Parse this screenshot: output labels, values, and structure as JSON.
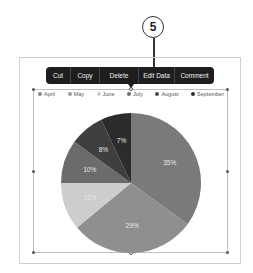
{
  "callout": {
    "number": "5"
  },
  "toolbar": {
    "items": [
      {
        "label": "Cut",
        "width": 25
      },
      {
        "label": "Copy",
        "width": 29
      },
      {
        "label": "Delete",
        "width": 39
      },
      {
        "label": "Edit Data",
        "width": 36
      },
      {
        "label": "Comment",
        "width": 39
      }
    ]
  },
  "legend": {
    "items": [
      {
        "label": "April",
        "color": "#8a8a8a"
      },
      {
        "label": "May",
        "color": "#9a9a9a"
      },
      {
        "label": "June",
        "color": "#cfcfcf"
      },
      {
        "label": "July",
        "color": "#6e6e6e"
      },
      {
        "label": "August",
        "color": "#4a4a4a"
      },
      {
        "label": "September",
        "color": "#2e2e2e"
      }
    ]
  },
  "chart_data": {
    "type": "pie",
    "title": "",
    "categories": [
      "April",
      "May",
      "June",
      "July",
      "August",
      "September"
    ],
    "values": [
      35,
      29,
      11,
      10,
      8,
      7
    ],
    "labels": [
      "35%",
      "29%",
      "11%",
      "10%",
      "8%",
      "7%"
    ],
    "colors": [
      "#7a7a7a",
      "#8f8f8f",
      "#cdcdcd",
      "#6b6b6b",
      "#3f3f3f",
      "#2c2c2c"
    ],
    "legend_position": "top"
  }
}
